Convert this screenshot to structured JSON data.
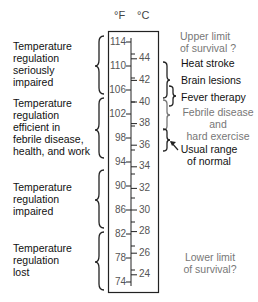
{
  "units": {
    "fahrenheit": "°F",
    "celsius": "°C"
  },
  "scale": {
    "fahrenheit_ticks": [
      "114",
      "110",
      "106",
      "102",
      "98",
      "94",
      "90",
      "86",
      "82",
      "78",
      "74"
    ],
    "celsius_ticks": [
      "44",
      "42",
      "40",
      "38",
      "36",
      "34",
      "32",
      "30",
      "28",
      "26",
      "24"
    ]
  },
  "left_labels": [
    {
      "lines": [
        "Temperature",
        "regulation",
        "seriously",
        "impaired"
      ]
    },
    {
      "lines": [
        "Temperature",
        "regulation",
        "efficient in",
        "febrile disease,",
        "health, and work"
      ]
    },
    {
      "lines": [
        "Temperature",
        "regulation",
        "impaired"
      ]
    },
    {
      "lines": [
        "Temperature",
        "regulation",
        "lost"
      ]
    }
  ],
  "right_labels": {
    "upper_limit": [
      "Upper limit",
      "of survival ?"
    ],
    "heat_stroke": "Heat stroke",
    "brain_lesions": "Brain lesions",
    "fever_therapy": "Fever therapy",
    "febrile": [
      "Febrile disease",
      "and",
      "hard exercise"
    ],
    "normal": [
      "Usual range",
      "of normal"
    ],
    "lower_limit": [
      "Lower limit",
      "of survival?"
    ]
  },
  "colors": {
    "text": "#111111",
    "gray_text": "#777777",
    "line": "#222222"
  }
}
